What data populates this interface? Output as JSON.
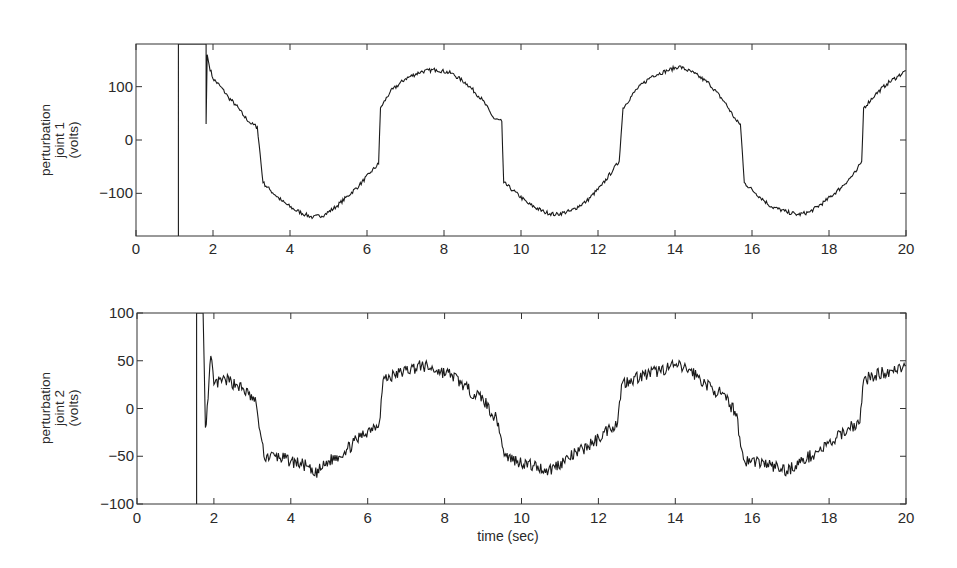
{
  "chart_data": [
    {
      "type": "line",
      "title": "",
      "ylabel_lines": [
        "perturbation",
        "joint 1",
        "(volts)"
      ],
      "ylabel": "perturbation joint 1 (volts)",
      "xlabel": "",
      "xlim": [
        0,
        20
      ],
      "ylim": [
        -180,
        180
      ],
      "xticks": [
        0,
        2,
        4,
        6,
        8,
        10,
        12,
        14,
        16,
        18,
        20
      ],
      "yticks": [
        -100,
        0,
        100
      ],
      "ytick_labels": [
        "−100",
        "0",
        "100"
      ],
      "grid": false,
      "legend": null,
      "series": [
        {
          "name": "joint 1 perturbation",
          "x": [
            1.1,
            1.1,
            1.1,
            1.82,
            1.82,
            1.85,
            1.9,
            2.0,
            2.2,
            2.4,
            2.6,
            2.8,
            3.0,
            3.15,
            3.3,
            3.5,
            3.8,
            4.1,
            4.4,
            4.6,
            4.9,
            5.2,
            5.5,
            5.8,
            6.1,
            6.3,
            6.35,
            6.6,
            7.0,
            7.4,
            7.8,
            8.2,
            8.6,
            9.0,
            9.3,
            9.5,
            9.55,
            9.8,
            10.2,
            10.6,
            10.9,
            11.3,
            11.7,
            12.1,
            12.4,
            12.55,
            12.65,
            13.0,
            13.4,
            13.8,
            14.1,
            14.5,
            14.9,
            15.3,
            15.6,
            15.7,
            15.8,
            16.1,
            16.5,
            16.9,
            17.2,
            17.5,
            17.9,
            18.3,
            18.7,
            18.85,
            18.9,
            19.2,
            19.5,
            19.8,
            20.0
          ],
          "y": [
            -180,
            180,
            180,
            180,
            30,
            160,
            140,
            115,
            100,
            80,
            65,
            45,
            30,
            25,
            -80,
            -95,
            -115,
            -130,
            -140,
            -145,
            -140,
            -125,
            -105,
            -85,
            -60,
            -45,
            60,
            90,
            115,
            128,
            132,
            125,
            105,
            75,
            40,
            35,
            -80,
            -95,
            -120,
            -135,
            -140,
            -133,
            -115,
            -85,
            -55,
            -40,
            60,
            95,
            120,
            130,
            138,
            125,
            105,
            70,
            35,
            30,
            -80,
            -100,
            -125,
            -135,
            -140,
            -135,
            -115,
            -90,
            -60,
            -40,
            60,
            85,
            105,
            120,
            130
          ]
        }
      ]
    },
    {
      "type": "line",
      "title": "",
      "ylabel_lines": [
        "perturbation",
        "joint 2",
        "(volts)"
      ],
      "ylabel": "perturbation joint 2 (volts)",
      "xlabel": "time (sec)",
      "xlim": [
        0,
        20
      ],
      "ylim": [
        -100,
        100
      ],
      "xticks": [
        0,
        2,
        4,
        6,
        8,
        10,
        12,
        14,
        16,
        18,
        20
      ],
      "yticks": [
        -100,
        -50,
        0,
        50,
        100
      ],
      "ytick_labels": [
        "−100",
        "−50",
        "0",
        "50",
        "100"
      ],
      "grid": false,
      "legend": null,
      "series": [
        {
          "name": "joint 2 perturbation",
          "x": [
            1.55,
            1.55,
            1.55,
            1.72,
            1.78,
            1.85,
            1.92,
            2.0,
            2.3,
            2.6,
            2.9,
            3.1,
            3.15,
            3.3,
            3.6,
            4.0,
            4.4,
            4.6,
            5.0,
            5.4,
            5.8,
            6.1,
            6.3,
            6.4,
            6.7,
            7.0,
            7.4,
            7.8,
            8.2,
            8.6,
            9.0,
            9.4,
            9.5,
            9.6,
            9.9,
            10.3,
            10.7,
            11.1,
            11.5,
            11.9,
            12.3,
            12.5,
            12.6,
            12.8,
            13.2,
            13.6,
            14.0,
            14.4,
            14.8,
            15.2,
            15.6,
            15.7,
            15.8,
            16.1,
            16.5,
            16.9,
            17.3,
            17.7,
            18.1,
            18.5,
            18.8,
            18.9,
            19.2,
            19.6,
            20.0
          ],
          "y": [
            -100,
            100,
            100,
            100,
            -20,
            10,
            55,
            25,
            30,
            25,
            15,
            5,
            -10,
            -50,
            -50,
            -55,
            -60,
            -70,
            -55,
            -45,
            -30,
            -20,
            -15,
            30,
            35,
            40,
            45,
            40,
            35,
            20,
            10,
            -15,
            -40,
            -50,
            -55,
            -60,
            -65,
            -55,
            -45,
            -35,
            -20,
            -15,
            25,
            30,
            35,
            40,
            45,
            40,
            25,
            15,
            -5,
            -40,
            -55,
            -55,
            -60,
            -65,
            -55,
            -45,
            -35,
            -20,
            -15,
            30,
            35,
            40,
            45
          ]
        }
      ]
    }
  ],
  "figure": {
    "line_color": "#1a1a1a",
    "axis_color": "#333333",
    "background": "#ffffff"
  },
  "text": {
    "plot1_ylabel": [
      "perturbation",
      "joint 1",
      "(volts)"
    ],
    "plot2_ylabel": [
      "perturbation",
      "joint 2",
      "(volts)"
    ],
    "xlabel": "time (sec)"
  }
}
